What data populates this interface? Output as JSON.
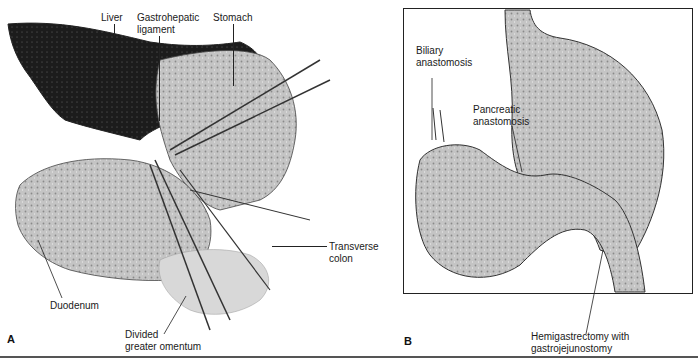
{
  "figure": {
    "panels": [
      {
        "letter": "A",
        "labels": {
          "liver": "Liver",
          "gastrohepatic_1": "Gastrohepatic",
          "gastrohepatic_2": "ligament",
          "stomach": "Stomach",
          "transverse_1": "Transverse",
          "transverse_2": "colon",
          "duodenum": "Duodenum",
          "omentum_1": "Divided",
          "omentum_2": "greater omentum"
        }
      },
      {
        "letter": "B",
        "labels": {
          "biliary_1": "Biliary",
          "biliary_2": "anastomosis",
          "pancreatic_1": "Pancreatic",
          "pancreatic_2": "anastomosis",
          "hemi_1": "Hemigastrectomy with",
          "hemi_2": "gastrojejunostomy"
        }
      }
    ],
    "colors": {
      "ink": "#1a1a1a",
      "organ_fill": "#bdbdbd",
      "liver_fill": "#1c1c1c",
      "background": "#ffffff"
    }
  }
}
